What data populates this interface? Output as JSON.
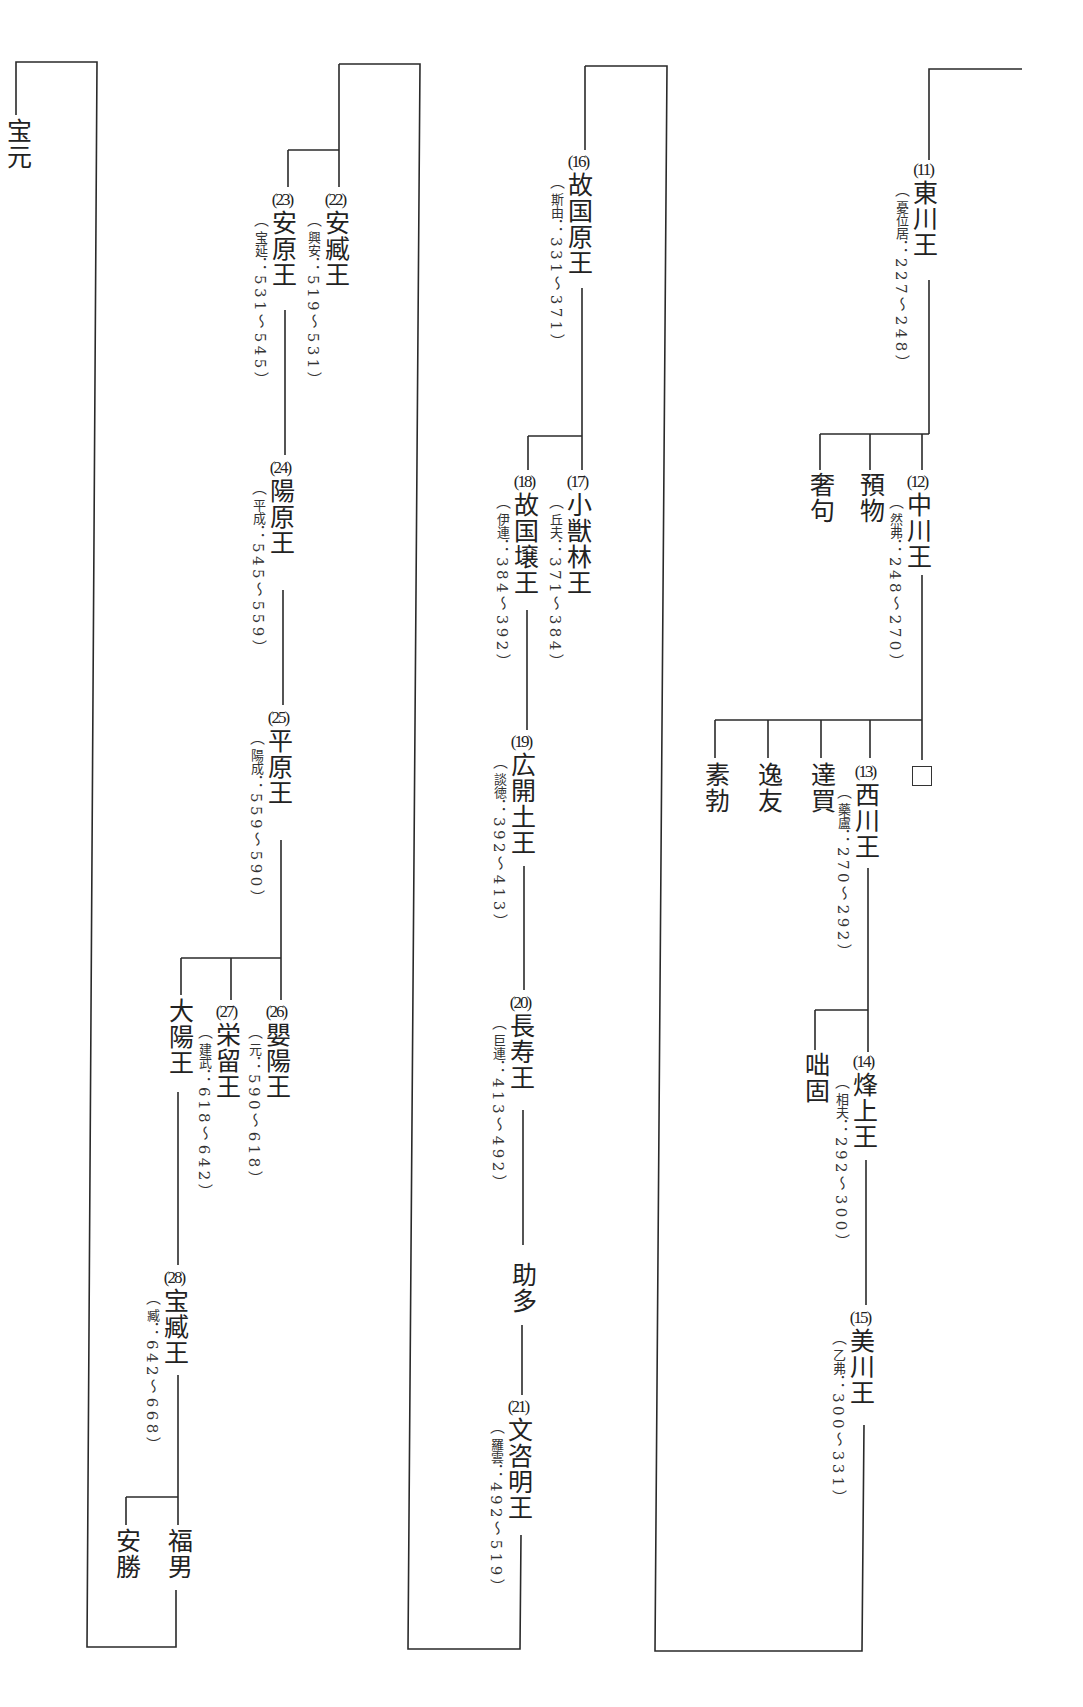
{
  "diagram": {
    "type": "genealogy",
    "title": "",
    "orientation": "vertical-rl",
    "line_color": "#2a2a2a",
    "nodes": {
      "hogen": {
        "name": "宝元"
      },
      "k11": {
        "num": "(11)",
        "name": "東川王",
        "personal_name": "憂位居",
        "reign": "：227〜248）"
      },
      "shaku": {
        "name": "奢句"
      },
      "yobutsu": {
        "name": "預物"
      },
      "k12": {
        "num": "(12)",
        "name": "中川王",
        "personal_name": "然弗",
        "reign": "：248〜270）"
      },
      "sobotsu": {
        "name": "素勃"
      },
      "itsuyu": {
        "name": "逸友"
      },
      "tatsubai": {
        "name": "達買"
      },
      "k13": {
        "num": "(13)",
        "name": "西川王",
        "personal_name": "藥盧",
        "reign": "：270〜292）"
      },
      "unknown": {
        "name": "□"
      },
      "tokko": {
        "name": "咄固"
      },
      "k14": {
        "num": "(14)",
        "name": "烽上王",
        "personal_name": "相夫",
        "reign": "：292〜300）"
      },
      "k15": {
        "num": "(15)",
        "name": "美川王",
        "personal_name": "乙弗",
        "reign": "：300〜331）"
      },
      "k16": {
        "num": "(16)",
        "name": "故国原王",
        "personal_name": "斯由",
        "reign": "：331〜371）"
      },
      "k17": {
        "num": "(17)",
        "name": "小獣林王",
        "personal_name": "丘夫",
        "reign": "：371〜384）"
      },
      "k18": {
        "num": "(18)",
        "name": "故国壌王",
        "personal_name": "伊連",
        "reign": "：384〜392）"
      },
      "k19": {
        "num": "(19)",
        "name": "広開土王",
        "personal_name": "談徳",
        "reign": "：392〜413）"
      },
      "k20": {
        "num": "(20)",
        "name": "長寿王",
        "personal_name": "巨連",
        "reign": "：413〜492）"
      },
      "joda": {
        "name": "助多"
      },
      "k21": {
        "num": "(21)",
        "name": "文咨明王",
        "personal_name": "羅雲",
        "reign": "：492〜519）"
      },
      "k22": {
        "num": "(22)",
        "name": "安臧王",
        "personal_name": "興安",
        "reign": "：519〜531）"
      },
      "k23": {
        "num": "(23)",
        "name": "安原王",
        "personal_name": "宝延",
        "reign": "：531〜545）"
      },
      "k24": {
        "num": "(24)",
        "name": "陽原王",
        "personal_name": "平成",
        "reign": "：545〜559）"
      },
      "k25": {
        "num": "(25)",
        "name": "平原王",
        "personal_name": "陽成",
        "reign": "：559〜590）"
      },
      "k26": {
        "num": "(26)",
        "name": "嬰陽王",
        "personal_name": "元",
        "reign": "：590〜618）"
      },
      "k27": {
        "num": "(27)",
        "name": "栄留王",
        "personal_name": "建武",
        "reign": "：618〜642）"
      },
      "taiyo": {
        "name": "大陽王"
      },
      "k28": {
        "num": "(28)",
        "name": "宝臧王",
        "personal_name": "臧",
        "reign": "：642〜668）"
      },
      "anshou": {
        "name": "安勝"
      },
      "fukuo": {
        "name": "福男"
      }
    }
  }
}
